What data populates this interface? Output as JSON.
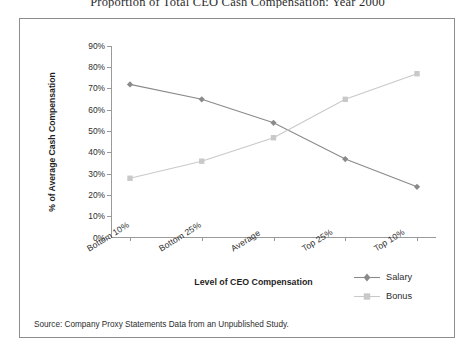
{
  "chart_data": {
    "type": "line",
    "title": "Proportion of Total CEO Cash Compensation: Year 2000",
    "xlabel": "Level of CEO Compensation",
    "ylabel": "% of Average Cash Compensation",
    "categories": [
      "Bottom 10%",
      "Bottom 25%",
      "Average",
      "Top 25%",
      "Top 10%"
    ],
    "series": [
      {
        "name": "Salary",
        "values": [
          72,
          65,
          54,
          37,
          24
        ],
        "color": "#8a8a8a",
        "marker": "diamond"
      },
      {
        "name": "Bonus",
        "values": [
          28,
          36,
          47,
          65,
          77
        ],
        "color": "#c9c9c9",
        "marker": "square"
      }
    ],
    "ylim": [
      0,
      90
    ],
    "yticks": [
      "0%",
      "10%",
      "20%",
      "30%",
      "40%",
      "50%",
      "60%",
      "70%",
      "80%",
      "90%"
    ],
    "ytick_values": [
      0,
      10,
      20,
      30,
      40,
      50,
      60,
      70,
      80,
      90
    ],
    "grid": false,
    "legend_position": "right-bottom"
  },
  "legend": {
    "items": [
      {
        "label": "Salary"
      },
      {
        "label": "Bonus"
      }
    ]
  },
  "source_note": "Source: Company Proxy Statements Data from an Unpublished Study."
}
